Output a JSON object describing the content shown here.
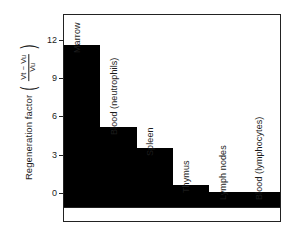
{
  "chart_data": {
    "type": "bar",
    "title": "",
    "subtitle": "",
    "xlabel": "",
    "ylabel": "Regeneration factor",
    "ylabel_fraction": {
      "numerator": "Vt − Vu",
      "denominator": "Vu",
      "open_paren": "(",
      "close_paren": ")"
    },
    "categories": [
      "Marrow",
      "Blood (neutrophils)",
      "Spleen",
      "Thymus",
      "Lymph nodes",
      "Blood (lymphocytes)"
    ],
    "values": [
      11.6,
      5.2,
      3.5,
      0.6,
      0.05,
      0.05
    ],
    "yticks": [
      "0",
      "3",
      "6",
      "9",
      "12"
    ],
    "ytick_values": [
      0,
      3,
      6,
      9,
      12
    ],
    "ylim": [
      0,
      14.1
    ],
    "grid": false,
    "legend": "none",
    "bar_color": "#000000",
    "frame_color": "#222222",
    "background": "#ffffff"
  },
  "axis": {
    "y_title_text": "Regeneration factor"
  }
}
